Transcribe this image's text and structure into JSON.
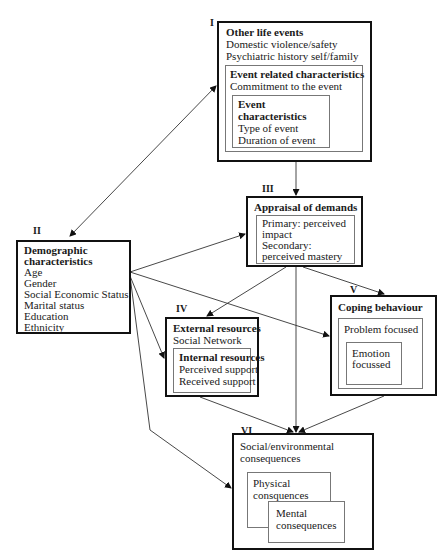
{
  "diagram": {
    "boxes": {
      "I": {
        "numeral": "I",
        "title": "Other life events",
        "lines": [
          "Domestic violence/safety",
          "Psychiatric history self/family"
        ],
        "inner": {
          "title": "Event related  characteristics",
          "lines": [
            "Commitment to the event"
          ],
          "inner": {
            "title_line1": "Event",
            "title_line2": "characteristics",
            "lines": [
              "Type of event",
              "Duration of event"
            ]
          }
        }
      },
      "II": {
        "numeral": "II",
        "title_line1": "Demographic",
        "title_line2": "characteristics",
        "lines": [
          "Age",
          "Gender",
          "Social Economic Status",
          "Marital status",
          "Education",
          "Ethnicity"
        ]
      },
      "III": {
        "numeral": "III",
        "title": "Appraisal of demands",
        "inner_lines": [
          "Primary: perceived",
          "impact",
          "Secondary:",
          "perceived mastery"
        ]
      },
      "IV": {
        "numeral": "IV",
        "title": "External resources",
        "lines": [
          "Social Network"
        ],
        "inner": {
          "title": "Internal resources",
          "lines": [
            "Perceived support",
            "Received support"
          ]
        }
      },
      "V": {
        "numeral": "V",
        "title": "Coping behaviour",
        "inner_label": "Problem focused",
        "inner_inner_lines": [
          "Emotion",
          "focussed"
        ]
      },
      "VI": {
        "numeral": "VI",
        "title_line1": "Social/environmental",
        "title_line2": "consequences",
        "physical_lines": [
          "Physical",
          "consquences"
        ],
        "mental_lines": [
          "Mental",
          "consequences"
        ]
      }
    },
    "connections": [
      {
        "from": "II",
        "to": "I",
        "type": "bidirectional"
      },
      {
        "from": "I",
        "to": "III",
        "type": "arrow"
      },
      {
        "from": "II",
        "to": "III",
        "type": "arrow"
      },
      {
        "from": "II",
        "to": "IV",
        "type": "arrow"
      },
      {
        "from": "II",
        "to": "V",
        "type": "arrow"
      },
      {
        "from": "II",
        "to": "VI",
        "type": "arrow"
      },
      {
        "from": "III",
        "to": "IV",
        "type": "arrow"
      },
      {
        "from": "III",
        "to": "V",
        "type": "arrow"
      },
      {
        "from": "III",
        "to": "VI",
        "type": "arrow"
      },
      {
        "from": "IV",
        "to": "VI",
        "type": "arrow"
      },
      {
        "from": "V",
        "to": "VI",
        "type": "arrow"
      }
    ]
  }
}
